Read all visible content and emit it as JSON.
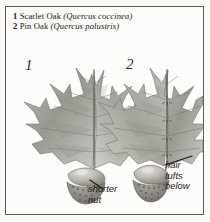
{
  "plate": {
    "background_color": "#fbfaf7",
    "frame_color": "#5d5c58",
    "ink_color": "#16150f"
  },
  "caption": {
    "entries": [
      {
        "number": "1",
        "common_name": "Scarlet Oak",
        "scientific_name": "(Quercus coccinea)"
      },
      {
        "number": "2",
        "common_name": "Pin Oak",
        "scientific_name": "(Quercus palustris)"
      }
    ]
  },
  "specimens": [
    {
      "number": "1",
      "label": "Scarlet Oak",
      "annotation": {
        "lines": [
          "shorter",
          "nut"
        ]
      }
    },
    {
      "number": "2",
      "label": "Pin Oak",
      "annotation": {
        "lines": [
          "hair",
          "tufts",
          "below"
        ]
      }
    }
  ],
  "illustration": {
    "style": "grayscale botanical engraving",
    "subjects": [
      "oak-leaf-lobed",
      "acorn",
      "acorn-cup-scales"
    ]
  }
}
